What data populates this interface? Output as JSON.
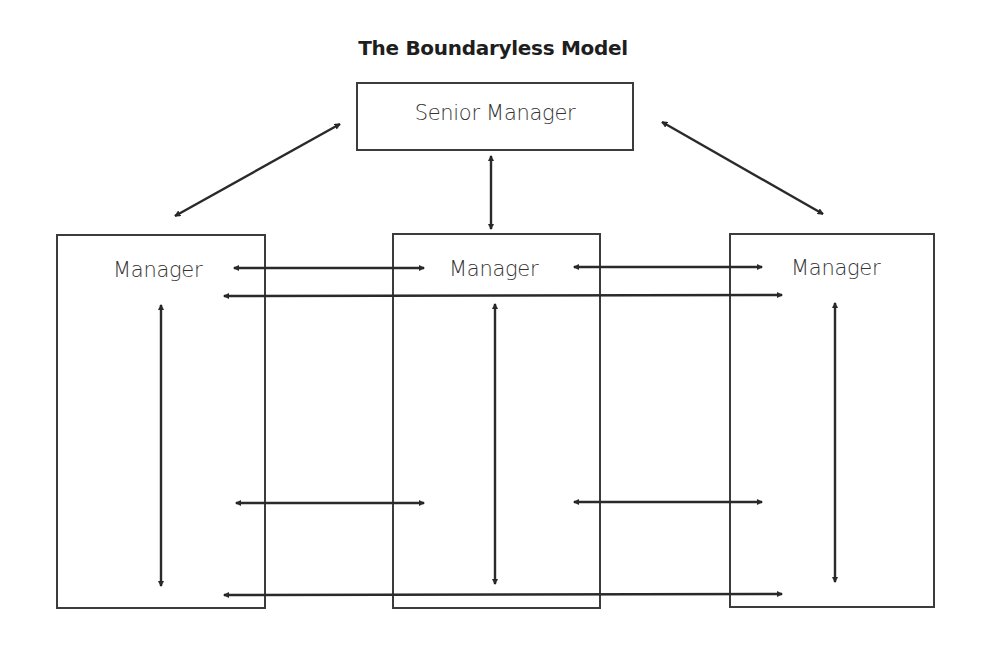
{
  "title": "The Boundaryless Model",
  "nodes": {
    "senior": {
      "label": "Senior Manager"
    },
    "manager_left": {
      "label": "Manager"
    },
    "manager_middle": {
      "label": "Manager"
    },
    "manager_right": {
      "label": "Manager"
    }
  },
  "colors": {
    "line": "#2a2a2a",
    "box_border": "#3c3c3c",
    "background": "#ffffff"
  },
  "connections": [
    {
      "from": "senior",
      "to": "manager_left",
      "type": "bidirectional"
    },
    {
      "from": "senior",
      "to": "manager_middle",
      "type": "bidirectional"
    },
    {
      "from": "senior",
      "to": "manager_right",
      "type": "bidirectional"
    },
    {
      "from": "manager_left",
      "to": "manager_middle",
      "type": "bidirectional",
      "row": "top"
    },
    {
      "from": "manager_middle",
      "to": "manager_right",
      "type": "bidirectional",
      "row": "top"
    },
    {
      "from": "manager_left",
      "to": "manager_right",
      "type": "bidirectional",
      "row": "top-wide"
    },
    {
      "from": "manager_left",
      "to": "manager_middle",
      "type": "bidirectional",
      "row": "bottom"
    },
    {
      "from": "manager_middle",
      "to": "manager_right",
      "type": "bidirectional",
      "row": "bottom"
    },
    {
      "from": "manager_left",
      "to": "manager_right",
      "type": "bidirectional",
      "row": "bottom-wide"
    },
    {
      "from": "manager_left",
      "to": "manager_left",
      "type": "vertical-internal"
    },
    {
      "from": "manager_middle",
      "to": "manager_middle",
      "type": "vertical-internal"
    },
    {
      "from": "manager_right",
      "to": "manager_right",
      "type": "vertical-internal"
    }
  ]
}
